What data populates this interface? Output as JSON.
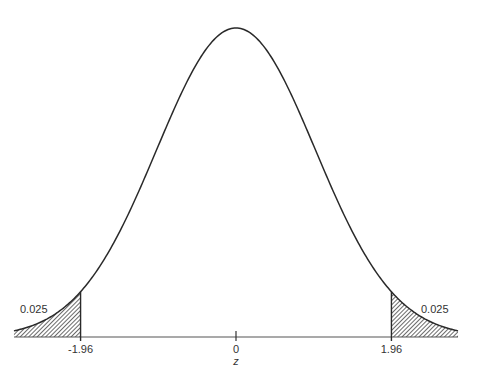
{
  "chart_data": {
    "type": "area",
    "title": "",
    "xlabel": "z",
    "ylabel": "",
    "xlim": [
      -2.8,
      2.8
    ],
    "distribution": {
      "name": "standard normal",
      "mean": 0,
      "sd": 1
    },
    "x_ticks": [
      {
        "value": -1.96,
        "label": "-1.96"
      },
      {
        "value": 0,
        "label": "0"
      },
      {
        "value": 1.96,
        "label": "1.96"
      }
    ],
    "shaded_regions": [
      {
        "name": "left-tail",
        "from": -2.8,
        "to": -1.96,
        "area": 0.025,
        "label": "0.025"
      },
      {
        "name": "right-tail",
        "from": 1.96,
        "to": 2.8,
        "area": 0.025,
        "label": "0.025"
      }
    ],
    "grid": false,
    "legend": null
  },
  "colors": {
    "line": "#2a2a2a",
    "hatch": "#2a2a2a",
    "background": "#ffffff"
  }
}
